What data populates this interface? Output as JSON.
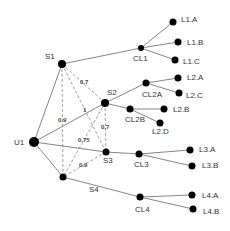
{
  "diagram": {
    "nodes": [
      {
        "id": "U1",
        "label": "U1",
        "x": 34,
        "y": 142,
        "r": 5,
        "lx": 14,
        "ly": 145
      },
      {
        "id": "S1",
        "label": "S1",
        "x": 62,
        "y": 64,
        "r": 4,
        "lx": 45,
        "ly": 59
      },
      {
        "id": "S2",
        "label": "S2",
        "x": 105,
        "y": 103,
        "r": 4,
        "lx": 107,
        "ly": 95
      },
      {
        "id": "S3",
        "label": "S3",
        "x": 106,
        "y": 152,
        "r": 3.5,
        "lx": 103,
        "ly": 163
      },
      {
        "id": "S4",
        "label": "S4",
        "x": 63,
        "y": 177,
        "r": 3.5,
        "lx": 89,
        "ly": 192
      },
      {
        "id": "CL1",
        "label": "CL1",
        "x": 141,
        "y": 48,
        "r": 3,
        "lx": 133,
        "ly": 61
      },
      {
        "id": "L1.A",
        "label": "L1.A",
        "x": 173,
        "y": 22,
        "r": 3.5,
        "lx": 181,
        "ly": 22
      },
      {
        "id": "L1.B",
        "label": "L1.B",
        "x": 178,
        "y": 42,
        "r": 3.5,
        "lx": 187,
        "ly": 45
      },
      {
        "id": "L1.C",
        "label": "L1.C",
        "x": 175,
        "y": 60,
        "r": 3.5,
        "lx": 183,
        "ly": 64
      },
      {
        "id": "CL2A",
        "label": "CL2A",
        "x": 146,
        "y": 83,
        "r": 3.5,
        "lx": 142,
        "ly": 97
      },
      {
        "id": "L2.A",
        "label": "L2.A",
        "x": 178,
        "y": 78,
        "r": 3.5,
        "lx": 187,
        "ly": 80
      },
      {
        "id": "L2.C",
        "label": "L2.C",
        "x": 179,
        "y": 93,
        "r": 3.5,
        "lx": 186,
        "ly": 98
      },
      {
        "id": "CL2B",
        "label": "CL2B",
        "x": 130,
        "y": 109,
        "r": 3.5,
        "lx": 125,
        "ly": 122
      },
      {
        "id": "L2.B",
        "label": "L2.B",
        "x": 164,
        "y": 109,
        "r": 3.5,
        "lx": 173,
        "ly": 112
      },
      {
        "id": "L2.D",
        "label": "L2.D",
        "x": 160,
        "y": 123,
        "r": 3.5,
        "lx": 152,
        "ly": 134
      },
      {
        "id": "CL3",
        "label": "CL3",
        "x": 139,
        "y": 154,
        "r": 3.5,
        "lx": 134,
        "ly": 167
      },
      {
        "id": "L3.A",
        "label": "L3.A",
        "x": 190,
        "y": 150,
        "r": 3.5,
        "lx": 199,
        "ly": 152
      },
      {
        "id": "L3.B",
        "label": "L3.B",
        "x": 192,
        "y": 166,
        "r": 3.5,
        "lx": 202,
        "ly": 168
      },
      {
        "id": "CL4",
        "label": "CL4",
        "x": 140,
        "y": 197,
        "r": 3.5,
        "lx": 135,
        "ly": 212
      },
      {
        "id": "L4.A",
        "label": "L4.A",
        "x": 192,
        "y": 195,
        "r": 3.5,
        "lx": 202,
        "ly": 198
      },
      {
        "id": "L4.B",
        "label": "L4.B",
        "x": 193,
        "y": 209,
        "r": 3.5,
        "lx": 203,
        "ly": 214
      }
    ],
    "edges": [
      {
        "from": "U1",
        "to": "S1"
      },
      {
        "from": "U1",
        "to": "S2"
      },
      {
        "from": "U1",
        "to": "S3"
      },
      {
        "from": "U1",
        "to": "S4"
      },
      {
        "from": "S1",
        "to": "CL1"
      },
      {
        "from": "CL1",
        "to": "L1.A"
      },
      {
        "from": "CL1",
        "to": "L1.B"
      },
      {
        "from": "CL1",
        "to": "L1.C"
      },
      {
        "from": "S2",
        "to": "CL2A"
      },
      {
        "from": "CL2A",
        "to": "L2.A"
      },
      {
        "from": "CL2A",
        "to": "L2.C"
      },
      {
        "from": "S2",
        "to": "CL2B"
      },
      {
        "from": "CL2B",
        "to": "L2.B"
      },
      {
        "from": "CL2B",
        "to": "L2.D"
      },
      {
        "from": "S3",
        "to": "CL3"
      },
      {
        "from": "CL3",
        "to": "L3.A"
      },
      {
        "from": "CL3",
        "to": "L3.B"
      },
      {
        "from": "S4",
        "to": "CL4"
      },
      {
        "from": "CL4",
        "to": "L4.A"
      },
      {
        "from": "CL4",
        "to": "L4.B"
      }
    ],
    "dashed_edges": [
      {
        "from": "S1",
        "to": "S2",
        "weight": "0.7",
        "wx": 80,
        "wy": 84
      },
      {
        "from": "S1",
        "to": "S3",
        "weight": "1",
        "wx": 83,
        "wy": 112
      },
      {
        "from": "S1",
        "to": "S4",
        "weight": "0.9",
        "wx": 58,
        "wy": 122
      },
      {
        "from": "S2",
        "to": "S3",
        "weight": "0.7",
        "wx": 101,
        "wy": 129
      },
      {
        "from": "S2",
        "to": "S4",
        "weight": "0.75",
        "wx": 78,
        "wy": 142
      },
      {
        "from": "S3",
        "to": "S4",
        "weight": "0.9",
        "wx": 79,
        "wy": 167
      }
    ]
  }
}
